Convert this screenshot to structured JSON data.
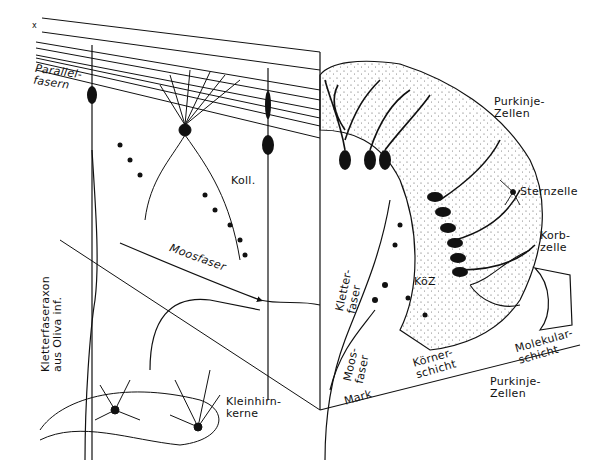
{
  "figure": {
    "corner_mark": "x",
    "labels": {
      "parallelfasern": "Parallel-\nfasern",
      "purkinje_top": "Purkinje-\nZellen",
      "koll": "Koll.",
      "sternzelle": "Sternzelle",
      "korbzelle": "Korb-\nzelle",
      "koz": "KöZ",
      "kletterfaser": "Kletter-\nfaser",
      "moosfaser_left": "Moosfaser",
      "moosfaser_mid": "Moos-\nfaser",
      "kletterfaseraxon": "Kletterfaseraxon\naus Oliva inf.",
      "koernerschicht": "Körner-\nschicht",
      "molekularschicht": "Molekular-\nschicht",
      "purkinje_bottom": "Purkinje-\nZellen",
      "mark": "Mark",
      "kleinhirnkerne": "Kleinhirn-\nkerne"
    }
  },
  "colors": {
    "ink": "#111111",
    "paper": "#ffffff",
    "stipple": "#555555"
  }
}
